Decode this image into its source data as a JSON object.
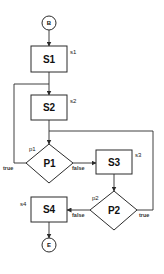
{
  "diagram": {
    "type": "flowchart",
    "nodes": {
      "begin": {
        "label": "B",
        "shape": "circle"
      },
      "s1": {
        "label": "S1",
        "tag": "s1",
        "shape": "rect"
      },
      "s2": {
        "label": "S2",
        "tag": "s2",
        "shape": "rect"
      },
      "p1": {
        "label": "P1",
        "tag": "p1",
        "shape": "diamond"
      },
      "s3": {
        "label": "S3",
        "tag": "s3",
        "shape": "rect"
      },
      "p2": {
        "label": "P2",
        "tag": "p2",
        "shape": "diamond"
      },
      "s4": {
        "label": "S4",
        "tag": "s4",
        "shape": "rect"
      },
      "end": {
        "label": "E",
        "shape": "circle"
      }
    },
    "edges": {
      "p1_true": "true",
      "p1_false": "false",
      "p2_false": "false",
      "p2_true": "true"
    },
    "connections": [
      {
        "from": "B",
        "to": "S1"
      },
      {
        "from": "S1",
        "to": "S2"
      },
      {
        "from": "S2",
        "to": "P1"
      },
      {
        "from": "P1",
        "to": "S2",
        "label": "true"
      },
      {
        "from": "P1",
        "to": "S3",
        "label": "false"
      },
      {
        "from": "S3",
        "to": "P2"
      },
      {
        "from": "P2",
        "to": "P1",
        "label": "true"
      },
      {
        "from": "P2",
        "to": "S4",
        "label": "false"
      },
      {
        "from": "S4",
        "to": "E"
      }
    ]
  }
}
